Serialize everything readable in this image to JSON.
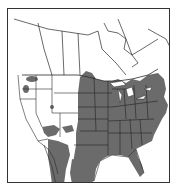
{
  "map": {
    "title": "Range map of North America",
    "region": "North America (Canada, United States, northern Mexico)",
    "legend": {
      "shaded": "Distribution range"
    },
    "colors": {
      "range_fill": "#6b6b6b",
      "land_fill": "#ffffff",
      "border_stroke": "#2a2a2a",
      "frame_stroke": "#333333"
    },
    "range_description": "Eastern and central United States from the Great Plains east to the Atlantic coast, including Texas and Florida; scattered populations in the Pacific Northwest, Utah, the Southwest (Arizona/New Mexico), and western and eastern Mexico"
  }
}
